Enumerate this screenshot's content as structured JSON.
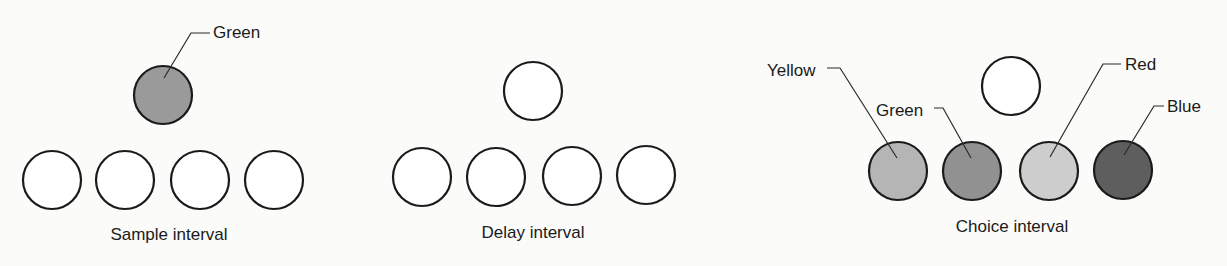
{
  "panels": [
    {
      "caption": "Sample interval",
      "top_stimulus": {
        "label": "Green",
        "fill": "#9a9a9a"
      },
      "bottom_keys": [
        {
          "fill": "#ffffff"
        },
        {
          "fill": "#ffffff"
        },
        {
          "fill": "#ffffff"
        },
        {
          "fill": "#ffffff"
        }
      ]
    },
    {
      "caption": "Delay interval",
      "top_stimulus": {
        "label": "",
        "fill": "#ffffff"
      },
      "bottom_keys": [
        {
          "fill": "#ffffff"
        },
        {
          "fill": "#ffffff"
        },
        {
          "fill": "#ffffff"
        },
        {
          "fill": "#ffffff"
        }
      ]
    },
    {
      "caption": "Choice interval",
      "top_stimulus": {
        "label": "",
        "fill": "#ffffff"
      },
      "bottom_keys": [
        {
          "label": "Yellow",
          "fill": "#b5b5b5"
        },
        {
          "label": "Green",
          "fill": "#919191"
        },
        {
          "label": "Red",
          "fill": "#cdcdcd"
        },
        {
          "label": "Blue",
          "fill": "#5e5e5e"
        }
      ]
    }
  ]
}
